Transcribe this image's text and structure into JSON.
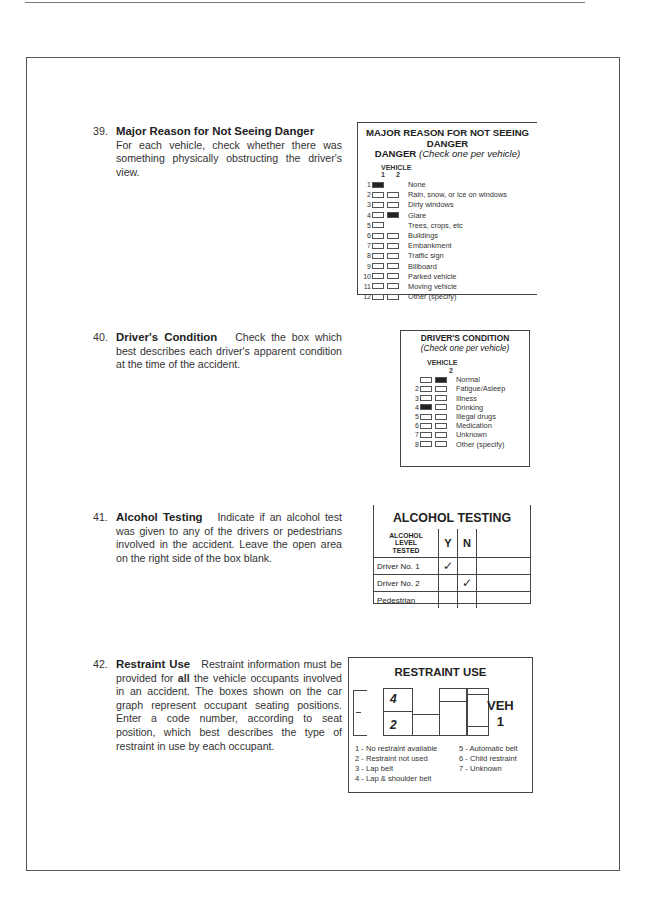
{
  "items": [
    {
      "number": "39.",
      "title": "Major Reason for Not Seeing Danger",
      "text": "For each vehicle, check whether there was something physically obstructing the driver's view."
    },
    {
      "number": "40.",
      "title": "Driver's Condition",
      "text": "Check the box which best describes each driver's apparent condition at the time of the accident."
    },
    {
      "number": "41.",
      "title": "Alcohol Testing",
      "text": "Indicate if an alcohol test was given to any of the drivers or pedestrians involved in the accident. Leave the open area on the right side of the box blank."
    },
    {
      "number": "42.",
      "title": "Restraint Use",
      "text_before_bold": "Restraint information must be provided for ",
      "bold": "all",
      "text_after_bold": " the vehicle occupants involved in an accident. The boxes shown on the car graph represent occupant seating positions. Enter a code number, according to seat position, which best describes the type of restraint in use by each occupant."
    }
  ],
  "box39": {
    "title": "MAJOR REASON FOR NOT SEEING DANGER",
    "subtitle": "(Check one per vehicle)",
    "vehicle_label": "VEHICLE",
    "vehicle_cols": [
      "1",
      "2"
    ],
    "rows": [
      {
        "n": "1",
        "label": "None",
        "v1": true,
        "v2": null
      },
      {
        "n": "2",
        "label": "Rain, snow, or ice on windows",
        "v1": false,
        "v2": false
      },
      {
        "n": "3",
        "label": "Dirty windows",
        "v1": false,
        "v2": false
      },
      {
        "n": "4",
        "label": "Glare",
        "v1": false,
        "v2": true
      },
      {
        "n": "5",
        "label": "Trees, crops, etc",
        "v1": false,
        "v2": null
      },
      {
        "n": "6",
        "label": "Buildings",
        "v1": false,
        "v2": false
      },
      {
        "n": "7",
        "label": "Embankment",
        "v1": false,
        "v2": false
      },
      {
        "n": "8",
        "label": "Traffic sign",
        "v1": false,
        "v2": false
      },
      {
        "n": "9",
        "label": "Billboard",
        "v1": false,
        "v2": false
      },
      {
        "n": "10",
        "label": "Parked vehicle",
        "v1": false,
        "v2": false
      },
      {
        "n": "11",
        "label": "Moving vehicle",
        "v1": false,
        "v2": false
      },
      {
        "n": "12",
        "label": "Other (specify)",
        "v1": false,
        "v2": false
      }
    ]
  },
  "box40": {
    "title": "DRIVER'S CONDITION",
    "subtitle": "(Check one per vehicle)",
    "vehicle_label": "VEHICLE",
    "vehicle_cols": [
      "",
      "2"
    ],
    "rows": [
      {
        "n": "",
        "label": "Normal",
        "v1": false,
        "v2": true
      },
      {
        "n": "2",
        "label": "Fatigue/Asleep",
        "v1": false,
        "v2": false
      },
      {
        "n": "3",
        "label": "Illness",
        "v1": false,
        "v2": false
      },
      {
        "n": "4",
        "label": "Drinking",
        "v1": true,
        "v2": false
      },
      {
        "n": "5",
        "label": "Illegal drugs",
        "v1": false,
        "v2": false
      },
      {
        "n": "6",
        "label": "Medication",
        "v1": false,
        "v2": false
      },
      {
        "n": "7",
        "label": "Unknown",
        "v1": false,
        "v2": false
      },
      {
        "n": "8",
        "label": "Other (specify)",
        "v1": false,
        "v2": false
      }
    ]
  },
  "alcohol": {
    "title": "ALCOHOL TESTING",
    "header": [
      "ALCOHOL",
      "LEVEL",
      "TESTED"
    ],
    "col_y": "Y",
    "col_n": "N",
    "check": "✓",
    "rows": [
      {
        "label": "Driver No. 1",
        "y": "✓",
        "n": ""
      },
      {
        "label": "Driver No. 2",
        "y": "",
        "n": "✓"
      },
      {
        "label": "Pedestrian",
        "y": "",
        "n": ""
      }
    ]
  },
  "restraint": {
    "title": "RESTRAINT USE",
    "seat_front": "4",
    "seat_rear": "2",
    "veh_label": "VEH",
    "veh_number": "1",
    "codes_left": [
      "1 - No restraint available",
      "2 - Restraint not used",
      "3 - Lap belt",
      "4 - Lap & shoulder belt"
    ],
    "codes_right": [
      "5 - Automatic belt",
      "6 - Child restraint",
      "7 - Unknown"
    ]
  }
}
